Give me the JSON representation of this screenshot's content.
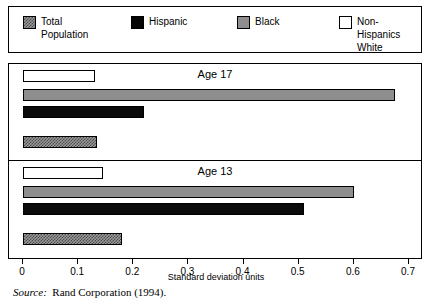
{
  "legend": {
    "items": [
      {
        "label": "Total\nPopulation",
        "swatch": "checker-swatch-icon",
        "color": "#9a9a9a",
        "left": 14
      },
      {
        "label": "Hispanic",
        "swatch": "black-swatch-icon",
        "color": "#050505",
        "left": 122
      },
      {
        "label": "Black",
        "swatch": "gray-swatch-icon",
        "color": "#8e8e8e",
        "left": 228
      },
      {
        "label": "Non-Hispanics\nWhite",
        "swatch": "white-swatch-icon",
        "color": "#ffffff",
        "left": 330
      }
    ]
  },
  "source": {
    "prefix": "Source:",
    "text": "Rand Corporation (1994)."
  },
  "chart_data": {
    "type": "bar",
    "orientation": "horizontal",
    "title": "",
    "xlabel": "Standard deviation units",
    "ylabel": "",
    "xlim": [
      0,
      0.7
    ],
    "xticks": [
      0,
      0.1,
      0.2,
      0.3,
      0.4,
      0.5,
      0.6,
      0.7
    ],
    "xticklabels": [
      "0",
      "0.1",
      "0.2",
      "0.3",
      "0.4",
      "0.5",
      "0.6",
      "0.7"
    ],
    "grid": false,
    "legend_position": "top",
    "panels": [
      {
        "name": "Age 17",
        "bars": [
          {
            "series": "Non-Hispanics White",
            "value": 0.13,
            "fill": "f-white",
            "row": 0
          },
          {
            "series": "Black",
            "value": 0.675,
            "fill": "f-gray",
            "row": 1
          },
          {
            "series": "Hispanic",
            "value": 0.22,
            "fill": "f-black",
            "row": 2
          },
          {
            "series": "Total Population",
            "value": 0.134,
            "fill": "f-checker",
            "row": 3
          }
        ]
      },
      {
        "name": "Age 13",
        "bars": [
          {
            "series": "Non-Hispanics White",
            "value": 0.145,
            "fill": "f-white",
            "row": 0
          },
          {
            "series": "Black",
            "value": 0.6,
            "fill": "f-gray",
            "row": 1
          },
          {
            "series": "Hispanic",
            "value": 0.51,
            "fill": "f-black",
            "row": 2
          },
          {
            "series": "Total Population",
            "value": 0.18,
            "fill": "f-checker",
            "row": 3
          }
        ]
      }
    ],
    "series_styles": {
      "Total Population": "checker",
      "Hispanic": "black",
      "Black": "gray",
      "Non-Hispanics White": "white"
    }
  }
}
